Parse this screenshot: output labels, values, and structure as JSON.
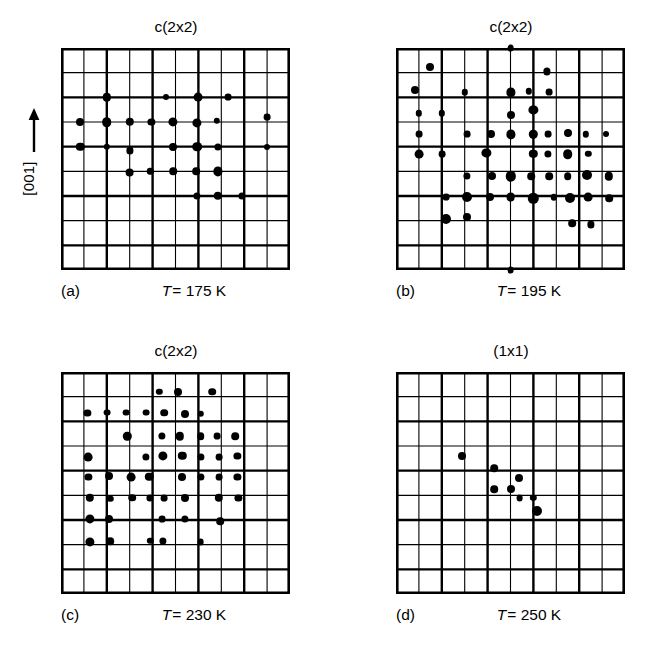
{
  "figure": {
    "axis_label": "[001]",
    "axis_arrow_icon": "up-arrow-icon",
    "background_color": "#ffffff",
    "dot_color": "#000000",
    "grid_color": "#000000"
  },
  "grid": {
    "cols": 10,
    "rows": 9,
    "major_every": 2,
    "minor_width": 1.1,
    "major_width": 2.4,
    "border_width": 2.6
  },
  "panels": [
    {
      "id": "panel-a",
      "letter": "(a)",
      "title": "c(2x2)",
      "temp_symbol": "T",
      "temp_value": "= 175 K",
      "dots": [
        {
          "x": 2.0,
          "y": 2.0,
          "r": 4.2
        },
        {
          "x": 4.6,
          "y": 2.0,
          "r": 3.0
        },
        {
          "x": 6.0,
          "y": 2.0,
          "r": 4.4
        },
        {
          "x": 7.3,
          "y": 2.0,
          "r": 3.4
        },
        {
          "x": 0.85,
          "y": 3.0,
          "r": 4.0
        },
        {
          "x": 2.0,
          "y": 3.0,
          "r": 4.8
        },
        {
          "x": 3.0,
          "y": 3.0,
          "r": 4.2
        },
        {
          "x": 3.95,
          "y": 3.0,
          "r": 3.6
        },
        {
          "x": 4.9,
          "y": 3.0,
          "r": 4.6
        },
        {
          "x": 5.95,
          "y": 3.05,
          "r": 4.6
        },
        {
          "x": 6.8,
          "y": 2.95,
          "r": 3.2
        },
        {
          "x": 9.0,
          "y": 2.8,
          "r": 3.4
        },
        {
          "x": 0.85,
          "y": 4.0,
          "r": 4.2
        },
        {
          "x": 2.0,
          "y": 4.0,
          "r": 3.2
        },
        {
          "x": 3.0,
          "y": 4.15,
          "r": 3.6
        },
        {
          "x": 4.9,
          "y": 4.0,
          "r": 4.0
        },
        {
          "x": 5.95,
          "y": 4.0,
          "r": 4.8
        },
        {
          "x": 6.85,
          "y": 4.0,
          "r": 3.6
        },
        {
          "x": 9.0,
          "y": 4.0,
          "r": 3.0
        },
        {
          "x": 3.0,
          "y": 5.05,
          "r": 4.4
        },
        {
          "x": 3.9,
          "y": 5.0,
          "r": 3.2
        },
        {
          "x": 4.9,
          "y": 5.0,
          "r": 3.8
        },
        {
          "x": 5.9,
          "y": 5.0,
          "r": 3.8
        },
        {
          "x": 6.85,
          "y": 5.0,
          "r": 4.6
        },
        {
          "x": 5.95,
          "y": 6.0,
          "r": 3.6
        },
        {
          "x": 6.85,
          "y": 6.0,
          "r": 4.2
        },
        {
          "x": 7.9,
          "y": 6.0,
          "r": 3.6
        }
      ]
    },
    {
      "id": "panel-b",
      "letter": "(b)",
      "title": "c(2x2)",
      "temp_symbol": "T",
      "temp_value": "= 195 K",
      "dots": [
        {
          "x": 5.0,
          "y": 0.0,
          "r": 3.4
        },
        {
          "x": 1.5,
          "y": 0.75,
          "r": 4.0
        },
        {
          "x": 6.6,
          "y": 0.95,
          "r": 3.6
        },
        {
          "x": 0.85,
          "y": 1.7,
          "r": 4.0
        },
        {
          "x": 3.0,
          "y": 1.8,
          "r": 3.2
        },
        {
          "x": 5.0,
          "y": 1.8,
          "r": 4.6
        },
        {
          "x": 5.8,
          "y": 1.75,
          "r": 3.2
        },
        {
          "x": 6.7,
          "y": 1.8,
          "r": 3.4
        },
        {
          "x": 1.0,
          "y": 2.65,
          "r": 3.2
        },
        {
          "x": 2.0,
          "y": 2.65,
          "r": 3.2
        },
        {
          "x": 5.0,
          "y": 2.7,
          "r": 4.0
        },
        {
          "x": 6.0,
          "y": 2.5,
          "r": 4.6
        },
        {
          "x": 1.0,
          "y": 3.5,
          "r": 3.4
        },
        {
          "x": 3.1,
          "y": 3.5,
          "r": 3.4
        },
        {
          "x": 4.15,
          "y": 3.5,
          "r": 4.0
        },
        {
          "x": 5.0,
          "y": 3.5,
          "r": 4.6
        },
        {
          "x": 6.0,
          "y": 3.5,
          "r": 4.2
        },
        {
          "x": 6.65,
          "y": 3.5,
          "r": 3.4
        },
        {
          "x": 7.5,
          "y": 3.45,
          "r": 4.0
        },
        {
          "x": 8.3,
          "y": 3.5,
          "r": 3.2
        },
        {
          "x": 9.15,
          "y": 3.5,
          "r": 3.0
        },
        {
          "x": 1.0,
          "y": 4.3,
          "r": 4.4
        },
        {
          "x": 2.0,
          "y": 4.3,
          "r": 3.4
        },
        {
          "x": 3.95,
          "y": 4.25,
          "r": 4.6
        },
        {
          "x": 6.0,
          "y": 4.3,
          "r": 4.2
        },
        {
          "x": 6.65,
          "y": 4.3,
          "r": 3.6
        },
        {
          "x": 7.5,
          "y": 4.3,
          "r": 4.8
        },
        {
          "x": 8.4,
          "y": 4.3,
          "r": 3.2
        },
        {
          "x": 3.1,
          "y": 5.2,
          "r": 3.6
        },
        {
          "x": 4.2,
          "y": 5.2,
          "r": 4.0
        },
        {
          "x": 5.0,
          "y": 5.2,
          "r": 5.2
        },
        {
          "x": 5.9,
          "y": 5.2,
          "r": 3.8
        },
        {
          "x": 6.7,
          "y": 5.2,
          "r": 3.8
        },
        {
          "x": 7.5,
          "y": 5.2,
          "r": 3.8
        },
        {
          "x": 8.35,
          "y": 5.15,
          "r": 5.0
        },
        {
          "x": 9.3,
          "y": 5.2,
          "r": 4.2
        },
        {
          "x": 2.2,
          "y": 6.05,
          "r": 3.4
        },
        {
          "x": 3.1,
          "y": 6.05,
          "r": 5.0
        },
        {
          "x": 4.1,
          "y": 6.05,
          "r": 4.0
        },
        {
          "x": 5.0,
          "y": 6.05,
          "r": 4.4
        },
        {
          "x": 6.0,
          "y": 6.1,
          "r": 5.2
        },
        {
          "x": 6.9,
          "y": 6.05,
          "r": 3.2
        },
        {
          "x": 7.6,
          "y": 6.1,
          "r": 5.0
        },
        {
          "x": 8.4,
          "y": 6.05,
          "r": 4.4
        },
        {
          "x": 9.3,
          "y": 6.1,
          "r": 3.8
        },
        {
          "x": 2.2,
          "y": 6.95,
          "r": 5.0
        },
        {
          "x": 3.1,
          "y": 6.85,
          "r": 4.0
        },
        {
          "x": 7.7,
          "y": 7.1,
          "r": 3.8
        },
        {
          "x": 8.5,
          "y": 7.15,
          "r": 3.6
        },
        {
          "x": 5.0,
          "y": 9.0,
          "r": 3.4
        }
      ]
    },
    {
      "id": "panel-c",
      "letter": "(c)",
      "title": "c(2x2)",
      "temp_symbol": "T",
      "temp_value": "= 230 K",
      "dots": [
        {
          "x": 4.3,
          "y": 0.8,
          "r": 3.2
        },
        {
          "x": 5.1,
          "y": 0.8,
          "r": 4.0
        },
        {
          "x": 6.6,
          "y": 0.8,
          "r": 3.8
        },
        {
          "x": 1.15,
          "y": 1.65,
          "r": 3.6
        },
        {
          "x": 2.0,
          "y": 1.65,
          "r": 3.4
        },
        {
          "x": 2.85,
          "y": 1.65,
          "r": 3.4
        },
        {
          "x": 3.7,
          "y": 1.65,
          "r": 3.4
        },
        {
          "x": 4.5,
          "y": 1.65,
          "r": 3.8
        },
        {
          "x": 5.4,
          "y": 1.7,
          "r": 4.0
        },
        {
          "x": 6.1,
          "y": 1.7,
          "r": 3.2
        },
        {
          "x": 2.9,
          "y": 2.6,
          "r": 4.2
        },
        {
          "x": 4.4,
          "y": 2.6,
          "r": 3.6
        },
        {
          "x": 5.2,
          "y": 2.6,
          "r": 4.2
        },
        {
          "x": 6.1,
          "y": 2.6,
          "r": 3.8
        },
        {
          "x": 6.8,
          "y": 2.6,
          "r": 3.4
        },
        {
          "x": 7.6,
          "y": 2.6,
          "r": 3.8
        },
        {
          "x": 1.2,
          "y": 3.45,
          "r": 4.4
        },
        {
          "x": 3.7,
          "y": 3.45,
          "r": 3.6
        },
        {
          "x": 4.45,
          "y": 3.4,
          "r": 4.6
        },
        {
          "x": 5.3,
          "y": 3.4,
          "r": 4.2
        },
        {
          "x": 6.1,
          "y": 3.45,
          "r": 3.6
        },
        {
          "x": 6.9,
          "y": 3.45,
          "r": 3.4
        },
        {
          "x": 7.7,
          "y": 3.4,
          "r": 3.6
        },
        {
          "x": 1.2,
          "y": 4.25,
          "r": 3.6
        },
        {
          "x": 2.1,
          "y": 4.2,
          "r": 4.0
        },
        {
          "x": 3.05,
          "y": 4.25,
          "r": 4.4
        },
        {
          "x": 3.85,
          "y": 4.25,
          "r": 4.2
        },
        {
          "x": 5.3,
          "y": 4.25,
          "r": 4.0
        },
        {
          "x": 6.1,
          "y": 4.25,
          "r": 3.6
        },
        {
          "x": 6.9,
          "y": 4.25,
          "r": 3.4
        },
        {
          "x": 7.7,
          "y": 4.25,
          "r": 3.6
        },
        {
          "x": 1.25,
          "y": 5.1,
          "r": 4.2
        },
        {
          "x": 2.15,
          "y": 5.15,
          "r": 3.2
        },
        {
          "x": 3.1,
          "y": 5.1,
          "r": 3.8
        },
        {
          "x": 3.9,
          "y": 5.1,
          "r": 3.6
        },
        {
          "x": 4.5,
          "y": 5.1,
          "r": 3.4
        },
        {
          "x": 5.4,
          "y": 5.1,
          "r": 4.0
        },
        {
          "x": 6.9,
          "y": 5.1,
          "r": 4.2
        },
        {
          "x": 7.75,
          "y": 5.1,
          "r": 3.6
        },
        {
          "x": 1.25,
          "y": 5.95,
          "r": 4.6
        },
        {
          "x": 2.1,
          "y": 5.95,
          "r": 4.0
        },
        {
          "x": 4.4,
          "y": 5.95,
          "r": 3.4
        },
        {
          "x": 5.4,
          "y": 5.95,
          "r": 3.6
        },
        {
          "x": 6.95,
          "y": 6.05,
          "r": 3.8
        },
        {
          "x": 1.25,
          "y": 6.9,
          "r": 4.6
        },
        {
          "x": 2.15,
          "y": 6.85,
          "r": 3.8
        },
        {
          "x": 3.9,
          "y": 6.85,
          "r": 3.2
        },
        {
          "x": 4.45,
          "y": 6.85,
          "r": 3.6
        },
        {
          "x": 6.1,
          "y": 6.9,
          "r": 3.4
        }
      ]
    },
    {
      "id": "panel-d",
      "letter": "(d)",
      "title": "(1x1)",
      "temp_symbol": "T",
      "temp_value": "= 250 K",
      "dots": [
        {
          "x": 2.9,
          "y": 3.4,
          "r": 4.0
        },
        {
          "x": 4.3,
          "y": 3.9,
          "r": 3.8
        },
        {
          "x": 5.35,
          "y": 4.3,
          "r": 4.0
        },
        {
          "x": 4.3,
          "y": 4.75,
          "r": 3.8
        },
        {
          "x": 5.0,
          "y": 4.75,
          "r": 4.0
        },
        {
          "x": 5.4,
          "y": 5.1,
          "r": 3.4
        },
        {
          "x": 6.0,
          "y": 5.1,
          "r": 3.2
        },
        {
          "x": 6.15,
          "y": 5.65,
          "r": 5.0
        }
      ]
    }
  ]
}
